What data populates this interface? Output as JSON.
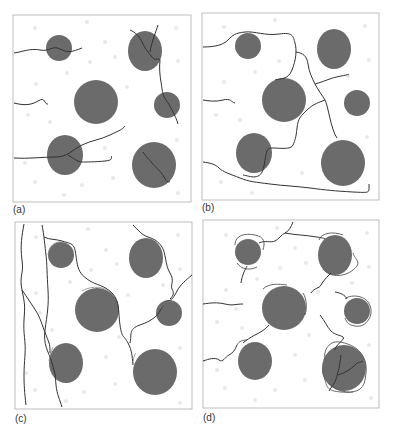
{
  "figure": {
    "colors": {
      "inclusion": "#6b6b6b",
      "crack": "#333333",
      "debond": "#555555",
      "frame": "#bdbdbd",
      "speckle": "#e6e6e6"
    },
    "panels": [
      {
        "id": "a",
        "label": "(a)"
      },
      {
        "id": "b",
        "label": "(b)"
      },
      {
        "id": "c",
        "label": "(c)"
      },
      {
        "id": "d",
        "label": "(d)"
      }
    ]
  }
}
